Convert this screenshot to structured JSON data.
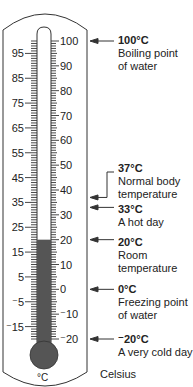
{
  "diagram": {
    "scale_label": "Celsius",
    "unit_symbol": "°C",
    "scale": {
      "min": -20,
      "max": 100,
      "y_at_max": 41,
      "y_at_min": 339
    },
    "mercury_level": 20,
    "right_labels": [
      "100",
      "90",
      "80",
      "70",
      "60",
      "50",
      "40",
      "30",
      "20",
      "10",
      "0",
      "⁻10",
      "⁻20"
    ],
    "right_values": [
      100,
      90,
      80,
      70,
      60,
      50,
      40,
      30,
      20,
      10,
      0,
      -10,
      -20
    ],
    "left_labels": [
      "95",
      "85",
      "75",
      "65",
      "55",
      "45",
      "35",
      "25",
      "15",
      "5",
      "⁻5",
      "⁻15"
    ],
    "left_values": [
      95,
      85,
      75,
      65,
      55,
      45,
      35,
      25,
      15,
      5,
      -5,
      -15
    ],
    "colors": {
      "outline": "#333333",
      "mercury": "#555555",
      "text": "#222222"
    }
  },
  "annotations": [
    {
      "temp": "100°C",
      "lines": [
        "Boiling point",
        "of water"
      ],
      "value": 100
    },
    {
      "temp": "37°C",
      "lines": [
        "Normal body",
        "temperature"
      ],
      "value": 37
    },
    {
      "temp": "33°C",
      "lines": [
        "A hot day"
      ],
      "value": 33
    },
    {
      "temp": "20°C",
      "lines": [
        "Room",
        "temperature"
      ],
      "value": 20
    },
    {
      "temp": "0°C",
      "lines": [
        "Freezing point",
        "of water"
      ],
      "value": 0
    },
    {
      "temp": "⁻20°C",
      "lines": [
        "A very cold day"
      ],
      "value": -20
    }
  ]
}
